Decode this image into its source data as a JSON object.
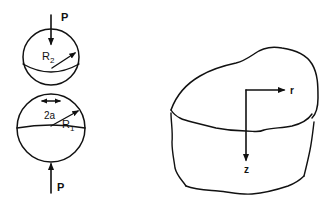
{
  "figure": {
    "colors": {
      "ink": "#111111",
      "background": "#ffffff"
    },
    "left_panel": {
      "name": "two-spheres-contact",
      "load_top": {
        "label": "P",
        "direction": "down"
      },
      "upper_sphere": {
        "radius_label": "R",
        "radius_sub": "2"
      },
      "contact_width": {
        "label": "2a"
      },
      "lower_sphere": {
        "radius_label": "R",
        "radius_sub": "1"
      },
      "load_bottom": {
        "label": "P",
        "direction": "up"
      }
    },
    "right_panel": {
      "name": "half-space-coordinates",
      "axis_r": {
        "label": "r"
      },
      "axis_z": {
        "label": "z"
      }
    }
  }
}
